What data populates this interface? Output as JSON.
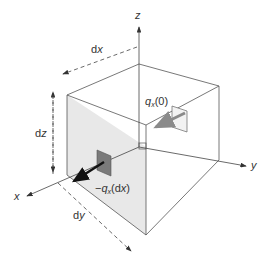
{
  "diagram": {
    "type": "3D control volume with heat flux in x-direction",
    "axes": {
      "x_label": "x",
      "y_label": "y",
      "z_label": "z"
    },
    "dimensions": {
      "dx_prefix": "d",
      "dx_var": "x",
      "dy_prefix": "d",
      "dy_var": "y",
      "dz_prefix": "d",
      "dz_var": "z"
    },
    "fluxes": {
      "inflow": {
        "symbol": "q",
        "subscript": "x",
        "arg": "(0)"
      },
      "outflow": {
        "sign": "−",
        "symbol": "q",
        "subscript": "x",
        "arg_open": "(d",
        "arg_var": "x",
        "arg_close": ")"
      }
    },
    "colors": {
      "line": "#555555",
      "shaded_face": "#e6e6e6",
      "back_patch": "#f2f2f2",
      "front_patch": "#7a7a7a",
      "inflow_arrow": "#8a8a8a",
      "outflow_arrow": "#111111"
    }
  }
}
